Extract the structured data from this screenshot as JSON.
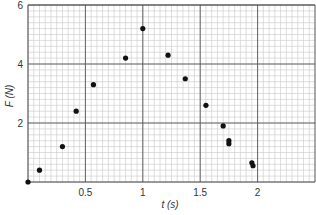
{
  "chart_data": {
    "type": "scatter",
    "title": "",
    "xlabel": "t (s)",
    "ylabel": "F (N)",
    "xlim": [
      0,
      2.5
    ],
    "ylim": [
      0,
      6
    ],
    "grid": true,
    "x_ticks": [
      {
        "value": 0.5,
        "label": "0.5"
      },
      {
        "value": 1,
        "label": "1"
      },
      {
        "value": 1.5,
        "label": "1.5"
      },
      {
        "value": 2,
        "label": "2"
      }
    ],
    "y_ticks": [
      {
        "value": 2,
        "label": "2"
      },
      {
        "value": 4,
        "label": "4"
      },
      {
        "value": 6,
        "label": "6"
      }
    ],
    "x_minor_step": 0.05,
    "y_minor_step": 0.2,
    "series": [
      {
        "name": "F vs t",
        "points": [
          {
            "x": 0.0,
            "y": 0.0
          },
          {
            "x": 0.1,
            "y": 0.4
          },
          {
            "x": 0.3,
            "y": 1.2
          },
          {
            "x": 0.42,
            "y": 2.4
          },
          {
            "x": 0.57,
            "y": 3.3
          },
          {
            "x": 0.85,
            "y": 4.2
          },
          {
            "x": 1.0,
            "y": 5.2
          },
          {
            "x": 1.22,
            "y": 4.3
          },
          {
            "x": 1.37,
            "y": 3.5
          },
          {
            "x": 1.55,
            "y": 2.6
          },
          {
            "x": 1.7,
            "y": 1.9
          },
          {
            "x": 1.75,
            "y": 1.4
          },
          {
            "x": 1.75,
            "y": 1.3
          },
          {
            "x": 1.95,
            "y": 0.65
          },
          {
            "x": 1.96,
            "y": 0.55
          }
        ]
      }
    ],
    "colors": {
      "grid_minor": "#c8c8c8",
      "grid_major": "#555555",
      "point": "#111111"
    }
  }
}
